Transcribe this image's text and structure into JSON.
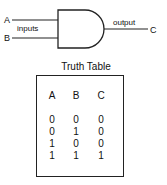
{
  "diagram": {
    "gate_type": "AND",
    "input_labels": [
      "A",
      "B"
    ],
    "inputs_caption": "inputs",
    "output_caption": "output",
    "output_label": "C"
  },
  "truth_table": {
    "title": "Truth Table",
    "headers": [
      "A",
      "B",
      "C"
    ],
    "rows": [
      [
        "0",
        "0",
        "0"
      ],
      [
        "0",
        "1",
        "0"
      ],
      [
        "1",
        "0",
        "0"
      ],
      [
        "1",
        "1",
        "1"
      ]
    ]
  }
}
